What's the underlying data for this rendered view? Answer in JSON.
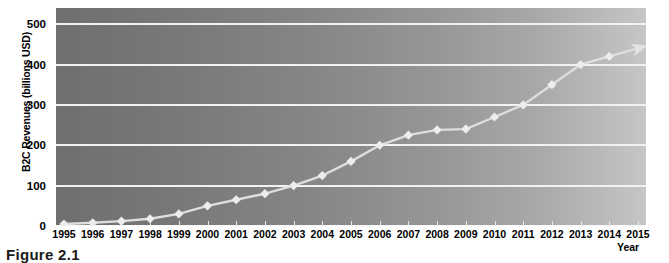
{
  "caption": "Figure 2.1",
  "chart_data": {
    "type": "line",
    "title": "",
    "xlabel": "Year",
    "ylabel": "B2C Revenues (billions USD)",
    "categories": [
      "1995",
      "1996",
      "1997",
      "1998",
      "1999",
      "2000",
      "2001",
      "2002",
      "2003",
      "2004",
      "2005",
      "2006",
      "2007",
      "2008",
      "2009",
      "2010",
      "2011",
      "2012",
      "2013",
      "2014",
      "2015"
    ],
    "x": [
      1995,
      1996,
      1997,
      1998,
      1999,
      2000,
      2001,
      2002,
      2003,
      2004,
      2005,
      2006,
      2007,
      2008,
      2009,
      2010,
      2011,
      2012,
      2013,
      2014,
      2015
    ],
    "values": [
      5,
      8,
      12,
      18,
      30,
      50,
      65,
      80,
      100,
      125,
      160,
      200,
      225,
      238,
      240,
      270,
      300,
      350,
      400,
      420,
      440
    ],
    "ylim": [
      0,
      540
    ],
    "yticks": [
      0,
      100,
      200,
      300,
      400,
      500
    ],
    "ytick_labels": [
      "0",
      "100",
      "200",
      "300",
      "400",
      "500"
    ],
    "xlim": [
      1995,
      2015
    ],
    "grid": "horizontal",
    "legend": "none",
    "marker": "diamond",
    "line_end": "arrow",
    "series_name": "B2C Revenues",
    "colors": {
      "line": "#e0e0e0",
      "marker": "#ededed",
      "gridline": "#f2f2f2",
      "plot_bg_left": "#6f6f6f",
      "plot_bg_right": "#c6c6c6",
      "text": "#000000",
      "page_bg": "#ffffff"
    }
  }
}
